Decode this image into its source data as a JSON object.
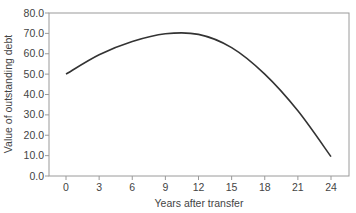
{
  "chart_data": {
    "type": "line",
    "title": "",
    "xlabel": "Years after transfer",
    "ylabel": "Value of outstanding debt",
    "xlim": [
      -1.5,
      25.5
    ],
    "ylim": [
      0,
      80
    ],
    "x_ticks": [
      0,
      3,
      6,
      9,
      12,
      15,
      18,
      21,
      24
    ],
    "y_ticks": [
      "0.0",
      "10.0",
      "20.0",
      "30.0",
      "40.0",
      "50.0",
      "60.0",
      "70.0",
      "80.0"
    ],
    "grid": false,
    "legend": null,
    "series": [
      {
        "name": "Value of outstanding debt",
        "x": [
          0,
          3,
          6,
          9,
          12,
          15,
          18,
          21,
          24
        ],
        "values": [
          50.0,
          59.5,
          66.0,
          69.8,
          69.5,
          63.0,
          50.0,
          32.0,
          9.5
        ]
      }
    ],
    "colors": {
      "line": "#333333",
      "axis": "#888888"
    }
  }
}
